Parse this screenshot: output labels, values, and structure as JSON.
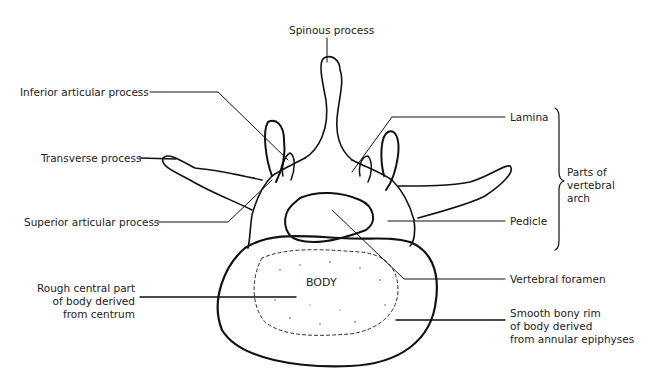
{
  "diagram": {
    "labels": {
      "spinous_process": "Spinous process",
      "inferior_articular_process": "Inferior articular process",
      "transverse_process": "Transverse process",
      "superior_articular_process": "Superior articular process",
      "rough_central_part": "Rough central part\nof body derived\nfrom centrum",
      "lamina": "Lamina",
      "parts_of_vertebral_arch": "Parts of\nvertebral\narch",
      "pedicle": "Pedicle",
      "vertebral_foramen": "Vertebral foramen",
      "smooth_bony_rim": "Smooth bony rim\nof body derived\nfrom annular epiphyses",
      "body": "BODY"
    },
    "colors": {
      "line": "#111111",
      "background": "#ffffff"
    }
  }
}
